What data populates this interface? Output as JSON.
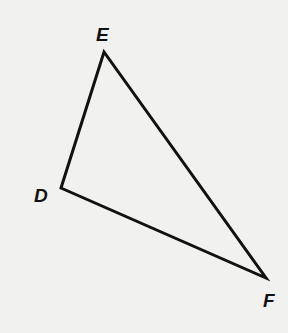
{
  "diagram": {
    "type": "triangle",
    "name": "Triangle DEF",
    "stroke_color": "#111111",
    "background_color": "#f1f1ef",
    "vertices": [
      {
        "label": "E",
        "x": 104,
        "y": 52,
        "label_x": 96,
        "label_y": 41
      },
      {
        "label": "D",
        "x": 61,
        "y": 188,
        "label_x": 34,
        "label_y": 202
      },
      {
        "label": "F",
        "x": 266,
        "y": 278,
        "label_x": 263,
        "label_y": 307
      }
    ],
    "edges": [
      {
        "from": "D",
        "to": "E"
      },
      {
        "from": "E",
        "to": "F"
      },
      {
        "from": "F",
        "to": "D"
      }
    ]
  }
}
